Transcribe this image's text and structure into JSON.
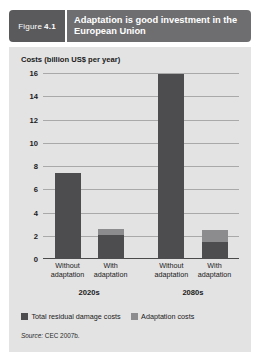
{
  "figure": {
    "tag_label": "Figure",
    "tag_number": "4.1",
    "title": "Adaptation is good investment in the European Union",
    "source_prefix": "Source:",
    "source_text": "CEC 2007b."
  },
  "colors": {
    "tag_bg": "#5a5a5c",
    "title_bg": "#6e6e70",
    "panel_bg": "#e3e3e3",
    "damage": "#4d4d4f",
    "adaptation": "#8c8c8e",
    "gridline": "#a9a9a9",
    "axis": "#4a4a4a"
  },
  "chart_data": {
    "type": "bar",
    "stacked": true,
    "title": "Adaptation is good investment in the European Union",
    "xlabel": "",
    "ylabel": "Costs (billion US$ per year)",
    "ylim": [
      0,
      16
    ],
    "yticks": [
      0,
      2,
      4,
      6,
      8,
      10,
      12,
      14,
      16
    ],
    "ytick_labels": [
      "0",
      "2",
      "4",
      "6",
      "8",
      "10",
      "12",
      "14",
      "16"
    ],
    "grid": true,
    "legend_position": "bottom-left",
    "categories": [
      "Without adaptation",
      "With adaptation",
      "Without adaptation",
      "With adaptation"
    ],
    "groups": [
      {
        "label": "2020s",
        "categories": [
          "Without adaptation",
          "With adaptation"
        ]
      },
      {
        "label": "2080s",
        "categories": [
          "Without adaptation",
          "With adaptation"
        ]
      }
    ],
    "series": [
      {
        "name": "Total residual damage costs",
        "color": "#4d4d4f",
        "values": [
          7.4,
          2.1,
          15.9,
          1.5
        ]
      },
      {
        "name": "Adaptation costs",
        "color": "#8c8c8e",
        "values": [
          0,
          0.5,
          0,
          1.0
        ]
      }
    ],
    "totals": [
      7.4,
      2.6,
      15.9,
      2.5
    ]
  }
}
